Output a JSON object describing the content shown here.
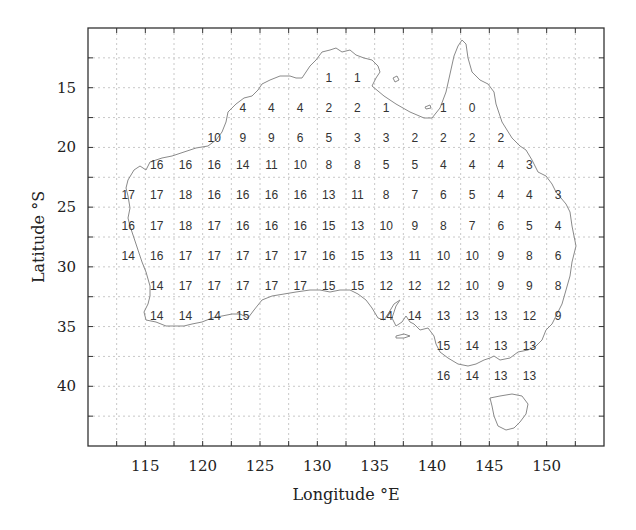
{
  "chart_data": {
    "type": "heatmap",
    "title": "",
    "xlabel": "Longitude °E",
    "ylabel": "Latitude °S",
    "xlim": [
      110,
      155
    ],
    "ylim": [
      10,
      45
    ],
    "x_ticks": [
      115,
      120,
      125,
      130,
      135,
      140,
      145,
      150
    ],
    "y_ticks": [
      15,
      20,
      25,
      30,
      35,
      40
    ],
    "grid": true,
    "legend": null,
    "annotation": "Gridded integer values over map of Australia",
    "columns_lon": [
      113.5,
      116,
      118.5,
      121,
      123.5,
      126,
      128.5,
      131,
      133.5,
      136,
      138.5,
      141,
      143.5,
      146,
      148.5,
      151
    ],
    "rows_lat": [
      14.2,
      16.7,
      19.2,
      21.5,
      24,
      26.6,
      29.1,
      31.6,
      34.1,
      36.6,
      39.1
    ],
    "cells": [
      {
        "row": 0,
        "values": [
          null,
          null,
          null,
          null,
          null,
          null,
          null,
          1,
          1,
          null,
          null,
          null,
          null,
          null,
          null,
          null
        ]
      },
      {
        "row": 1,
        "values": [
          null,
          null,
          null,
          null,
          4,
          4,
          4,
          2,
          2,
          1,
          null,
          1,
          0,
          null,
          null,
          null
        ]
      },
      {
        "row": 2,
        "values": [
          null,
          null,
          null,
          10,
          9,
          9,
          6,
          5,
          3,
          3,
          2,
          2,
          2,
          2,
          null,
          null
        ]
      },
      {
        "row": 3,
        "values": [
          null,
          16,
          16,
          16,
          14,
          11,
          10,
          8,
          8,
          5,
          5,
          4,
          4,
          4,
          3,
          null
        ]
      },
      {
        "row": 4,
        "values": [
          17,
          17,
          18,
          16,
          16,
          16,
          16,
          13,
          11,
          8,
          7,
          6,
          5,
          4,
          4,
          3
        ]
      },
      {
        "row": 5,
        "values": [
          16,
          17,
          18,
          17,
          16,
          16,
          16,
          15,
          13,
          10,
          9,
          8,
          7,
          6,
          5,
          4
        ]
      },
      {
        "row": 6,
        "values": [
          14,
          16,
          17,
          17,
          17,
          17,
          17,
          16,
          15,
          13,
          11,
          10,
          10,
          9,
          8,
          6
        ]
      },
      {
        "row": 7,
        "values": [
          null,
          14,
          17,
          17,
          17,
          17,
          17,
          15,
          15,
          12,
          12,
          12,
          10,
          9,
          9,
          8
        ]
      },
      {
        "row": 8,
        "values": [
          null,
          14,
          14,
          14,
          15,
          null,
          null,
          null,
          null,
          14,
          14,
          13,
          13,
          13,
          12,
          9
        ]
      },
      {
        "row": 9,
        "values": [
          null,
          null,
          null,
          null,
          null,
          null,
          null,
          null,
          null,
          null,
          null,
          15,
          14,
          13,
          13,
          null
        ]
      },
      {
        "row": 10,
        "values": [
          null,
          null,
          null,
          null,
          null,
          null,
          null,
          null,
          null,
          null,
          null,
          16,
          14,
          13,
          13,
          null
        ]
      }
    ]
  },
  "labels": {
    "xlabel": "Longitude °E",
    "ylabel": "Latitude °S"
  },
  "colors": {
    "frame": "#333333",
    "grid": "#c8c8c8",
    "coastline": "#8a8a8a",
    "text": "#333333"
  }
}
